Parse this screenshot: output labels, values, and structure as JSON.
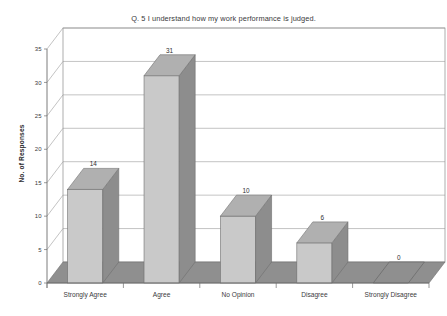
{
  "chart_data": {
    "type": "bar",
    "title": "Q. 5 I understand how my work performance is judged.",
    "xlabel": "",
    "ylabel": "No. of Responses",
    "categories": [
      "Strongly Agree",
      "Agree",
      "No Opinion",
      "Disagree",
      "Strongly Disagree"
    ],
    "values": [
      14,
      31,
      10,
      6,
      0
    ],
    "value_labels": [
      "14",
      "31",
      "10",
      "6",
      "0"
    ],
    "ylim": [
      0,
      35
    ],
    "yticks": [
      0,
      5,
      10,
      15,
      20,
      25,
      30,
      35
    ],
    "ytick_labels": [
      "0",
      "5",
      "10",
      "15",
      "20",
      "25",
      "30",
      "35"
    ],
    "grid": true,
    "legend": false,
    "style": "3d-column",
    "colors": {
      "bar_front": "#c9c9c9",
      "bar_top": "#b0b0b0",
      "bar_side": "#8d8d8d",
      "floor": "#8f8f8f",
      "wall": "#ffffff",
      "grid_line": "#9a9a9a",
      "axis_line": "#6e6e6e",
      "text": "#2e2e30"
    }
  }
}
